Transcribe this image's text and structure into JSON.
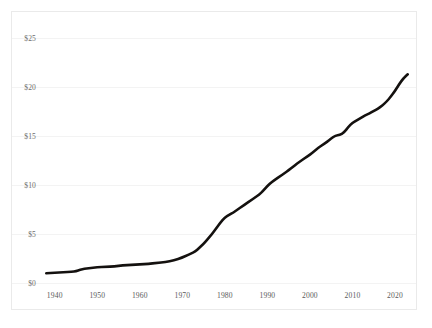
{
  "chart_data": {
    "type": "line",
    "title": "",
    "subtitle": "",
    "xlabel": "",
    "ylabel": "",
    "xlim": [
      1937,
      2024
    ],
    "ylim": [
      0,
      25
    ],
    "grid": true,
    "legend": "none",
    "y_tick_labels": [
      "$25",
      "$20",
      "$15",
      "$10",
      "$5",
      "$0"
    ],
    "y_tick_values": [
      25,
      20,
      15,
      10,
      5,
      0
    ],
    "x_tick_labels": [
      "1940",
      "1950",
      "1960",
      "1970",
      "1980",
      "1990",
      "2000",
      "2010",
      "2020"
    ],
    "x_tick_values": [
      1940,
      1950,
      1960,
      1970,
      1980,
      1990,
      2000,
      2010,
      2020
    ],
    "series": [
      {
        "name": "value",
        "color": "#14110f",
        "x": [
          1938,
          1940,
          1942,
          1944,
          1945,
          1946,
          1947,
          1948,
          1950,
          1952,
          1954,
          1956,
          1958,
          1960,
          1962,
          1964,
          1966,
          1968,
          1970,
          1971,
          1972,
          1973,
          1974,
          1975,
          1976,
          1977,
          1978,
          1979,
          1980,
          1981,
          1982,
          1983,
          1984,
          1985,
          1986,
          1987,
          1988,
          1989,
          1990,
          1991,
          1992,
          1993,
          1994,
          1995,
          1996,
          1997,
          1998,
          1999,
          2000,
          2001,
          2002,
          2003,
          2004,
          2005,
          2006,
          2007,
          2008,
          2009,
          2010,
          2011,
          2012,
          2013,
          2014,
          2015,
          2016,
          2017,
          2018,
          2019,
          2020,
          2021,
          2022,
          2023
        ],
        "y": [
          1.0,
          1.05,
          1.1,
          1.15,
          1.2,
          1.35,
          1.45,
          1.5,
          1.6,
          1.65,
          1.7,
          1.8,
          1.85,
          1.9,
          1.95,
          2.05,
          2.15,
          2.3,
          2.6,
          2.8,
          3.0,
          3.2,
          3.6,
          4.0,
          4.5,
          5.0,
          5.6,
          6.2,
          6.7,
          6.95,
          7.2,
          7.5,
          7.8,
          8.1,
          8.4,
          8.7,
          9.0,
          9.4,
          9.9,
          10.3,
          10.6,
          10.9,
          11.2,
          11.5,
          11.85,
          12.2,
          12.5,
          12.8,
          13.1,
          13.45,
          13.8,
          14.1,
          14.4,
          14.75,
          15.05,
          15.1,
          15.35,
          15.9,
          16.35,
          16.6,
          16.85,
          17.1,
          17.3,
          17.55,
          17.8,
          18.1,
          18.5,
          19.0,
          19.6,
          20.3,
          20.9,
          21.3
        ]
      }
    ]
  },
  "axes": {
    "y_labels": [
      {
        "text": "$25",
        "value": 25
      },
      {
        "text": "$20",
        "value": 20
      },
      {
        "text": "$15",
        "value": 15
      },
      {
        "text": "$10",
        "value": 10
      },
      {
        "text": "$5",
        "value": 5
      },
      {
        "text": "$0",
        "value": 0
      }
    ],
    "x_labels": [
      {
        "text": "1940",
        "value": 1940
      },
      {
        "text": "1950",
        "value": 1950
      },
      {
        "text": "1960",
        "value": 1960
      },
      {
        "text": "1970",
        "value": 1970
      },
      {
        "text": "1980",
        "value": 1980
      },
      {
        "text": "1990",
        "value": 1990
      },
      {
        "text": "2000",
        "value": 2000
      },
      {
        "text": "2010",
        "value": 2010
      },
      {
        "text": "2020",
        "value": 2020
      }
    ]
  },
  "colors": {
    "line": "#14110f",
    "grid": "#f3f3f3",
    "frame": "#eaeaea",
    "tick_text": "#6d6d6d",
    "background": "#ffffff"
  }
}
